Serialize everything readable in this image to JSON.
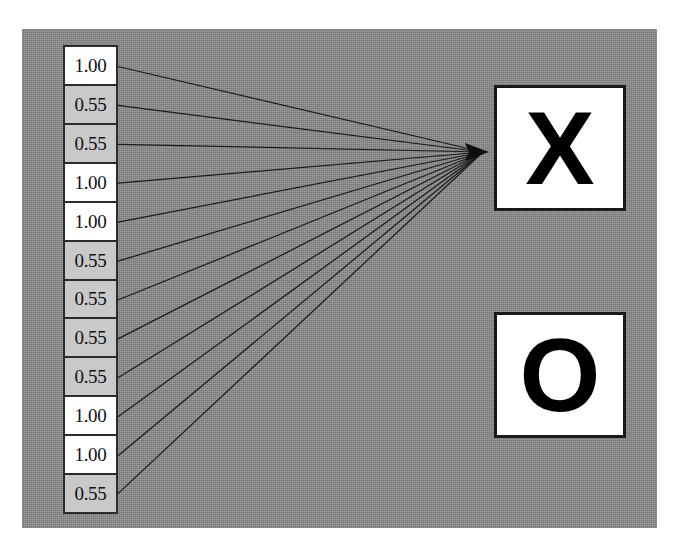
{
  "figure": {
    "title": "",
    "background_color": "#8b8b8b",
    "panel": {
      "x": 22,
      "y": 29,
      "width": 635,
      "height": 499
    }
  },
  "feature_column": {
    "name": "feature-vector",
    "cell_count": 12,
    "high_value_color": "#ffffff",
    "low_value_color": "#c9c9c9",
    "border_color": "#2b2b2b",
    "cells": [
      {
        "index": 0,
        "value": "1.00",
        "shade": "high"
      },
      {
        "index": 1,
        "value": "0.55",
        "shade": "low"
      },
      {
        "index": 2,
        "value": "0.55",
        "shade": "low"
      },
      {
        "index": 3,
        "value": "1.00",
        "shade": "high"
      },
      {
        "index": 4,
        "value": "1.00",
        "shade": "high"
      },
      {
        "index": 5,
        "value": "0.55",
        "shade": "low"
      },
      {
        "index": 6,
        "value": "0.55",
        "shade": "low"
      },
      {
        "index": 7,
        "value": "0.55",
        "shade": "low"
      },
      {
        "index": 8,
        "value": "0.55",
        "shade": "low"
      },
      {
        "index": 9,
        "value": "1.00",
        "shade": "high"
      },
      {
        "index": 10,
        "value": "1.00",
        "shade": "high"
      },
      {
        "index": 11,
        "value": "0.55",
        "shade": "low"
      }
    ]
  },
  "class_boxes": [
    {
      "name": "class-box-x",
      "label": "X",
      "x": 494,
      "y": 85,
      "width": 132,
      "height": 126,
      "is_target": true
    },
    {
      "name": "class-box-o",
      "label": "O",
      "x": 494,
      "y": 312,
      "width": 132,
      "height": 126,
      "is_target": false
    }
  ],
  "connectors": {
    "name": "fan-in-edges",
    "source_x": 118,
    "target_x": 489,
    "target_y": 152,
    "stroke_color": "#1b1b1b",
    "arrowhead": true,
    "count": 12
  },
  "chart_data": {
    "type": "diagram",
    "title": "",
    "xlabel": "",
    "ylabel": "",
    "categories": [
      "1",
      "2",
      "3",
      "4",
      "5",
      "6",
      "7",
      "8",
      "9",
      "10",
      "11",
      "12"
    ],
    "values": [
      1.0,
      0.55,
      0.55,
      1.0,
      1.0,
      0.55,
      0.55,
      0.55,
      0.55,
      1.0,
      1.0,
      0.55
    ],
    "legend": [
      "X",
      "O"
    ],
    "annotations": [
      "all 12 feature cells connect to class X"
    ]
  }
}
